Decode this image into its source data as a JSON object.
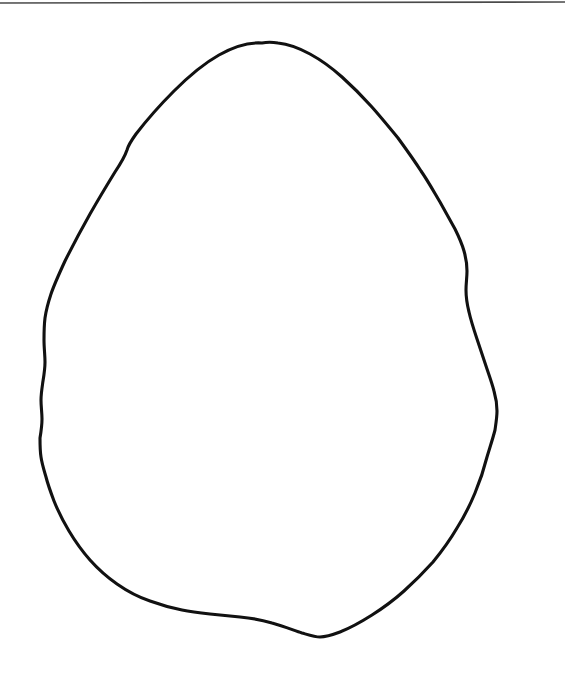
{
  "page": {
    "width": 565,
    "height": 678,
    "background_color": "#ffffff",
    "caption": ""
  },
  "top_rule": {
    "name": "horizontal-rule",
    "color": "#4a4a4a",
    "thickness": 1.6,
    "x1": 0,
    "y1": 3,
    "x2": 565,
    "y2": 2
  },
  "drawing": {
    "title": "",
    "stroke_color": "#111111",
    "fill_color": "#ffffff",
    "stroke_width": 3.1,
    "closed": true,
    "extents": {
      "left": 40,
      "top": 43,
      "right": 497,
      "bottom": 637
    },
    "key_points": {
      "apex": [
        262,
        43
      ],
      "leftmost": [
        40,
        445
      ],
      "rightmost": [
        497,
        430
      ],
      "bottom": [
        320,
        637
      ]
    },
    "outline_path": "M 262 43 C 247 42 233 47 219 55 C 203 64 188 77 174 91 C 160 105 146 121 136 134 C 131 141 128 146 127 150 C 125 156 121 163 115 172 C 107 185 98 200 90 214 C 81 230 72 247 65 261 C 59 274 54 285 51 294 C 48 303 46 311 45 318 C 44 326 44 333 44 340 C 44 348 45 355 45 362 C 45 369 44 375 43 381 C 42 388 41 394 41 400 C 41 407 42 413 42 419 C 42 426 41 432 40 438 C 40 445 40 451 41 457 C 42 464 44 470 46 477 C 48 485 51 493 54 501 C 58 511 63 521 69 531 C 75 541 82 551 90 560 C 98 569 107 577 117 584 C 127 591 138 597 150 601 C 161 605 172 608 182 610 C 192 612 201 613 210 614 C 220 615 230 616 240 617 C 251 618 262 620 272 623 C 283 626 293 630 302 633 C 309 635 315 637 320 637 C 326 637 332 635 340 632 C 350 628 361 622 372 615 C 383 608 394 600 404 591 C 414 582 424 572 433 562 C 442 551 450 540 457 528 C 464 517 470 505 475 493 C 480 481 484 469 487 457 C 490 447 493 438 495 430 C 496 423 497 417 497 411 C 497 404 496 398 494 391 C 492 383 489 375 486 366 C 483 357 480 348 477 339 C 474 330 471 321 469 312 C 467 304 466 297 466 290 C 466 283 467 277 467 271 C 467 264 466 258 464 251 C 462 244 459 237 455 229 C 450 220 445 211 440 202 C 434 192 428 181 421 171 C 414 160 406 149 398 138 C 389 127 380 116 371 106 C 362 96 352 86 342 77 C 332 68 321 60 310 54 C 299 48 288 44 278 43 C 272 42 267 42 262 43 Z"
  },
  "chart_data": {
    "type": "scatter",
    "title": "",
    "xlabel": "",
    "ylabel": "",
    "note": "Not a data chart; image is a freehand closed-contour line drawing."
  }
}
